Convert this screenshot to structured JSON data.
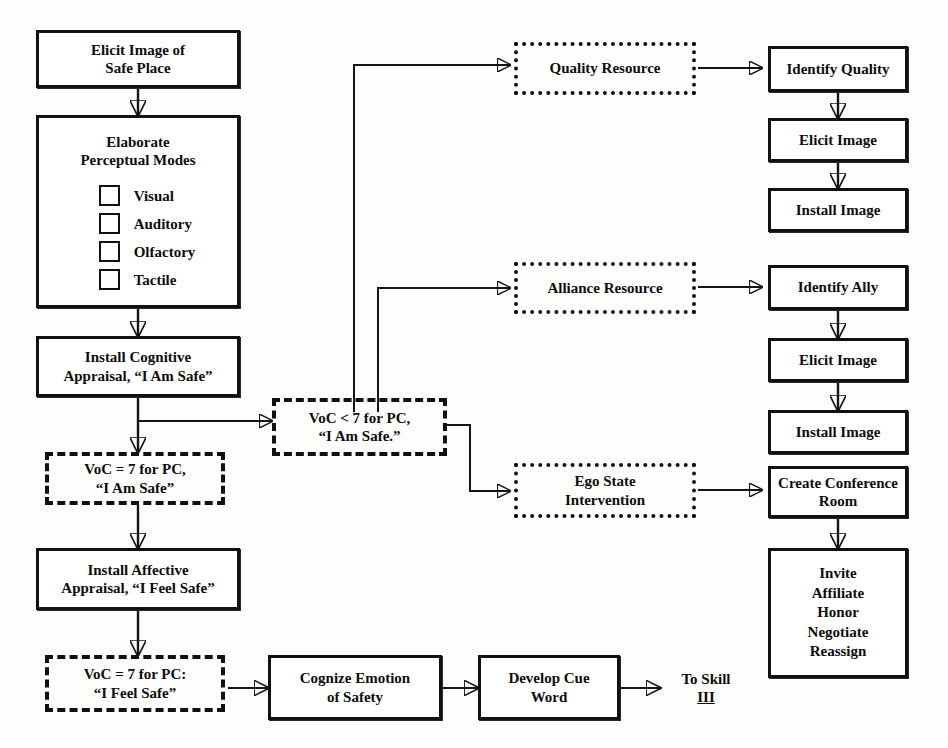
{
  "diagram": {
    "colors": {
      "stroke": "#151515",
      "node_border": "#111111",
      "text": "#0c0c0c",
      "background": "#fdfdfc"
    }
  },
  "nodes": {
    "elicit_image_safe_place": {
      "lines": [
        "Elicit Image of",
        "Safe Place"
      ],
      "style": "solid"
    },
    "elaborate_perceptual_modes": {
      "title_lines": [
        "Elaborate",
        "Perceptual Modes"
      ],
      "style": "solid",
      "modes": [
        "Visual",
        "Auditory",
        "Olfactory",
        "Tactile"
      ]
    },
    "install_cognitive_appraisal": {
      "lines": [
        "Install Cognitive",
        "Appraisal, “I Am Safe”"
      ],
      "style": "solid"
    },
    "voc_equals_7_i_am_safe": {
      "lines": [
        "VoC = 7 for PC,",
        "“I Am Safe”"
      ],
      "style": "dashed"
    },
    "voc_less_than_7_i_am_safe": {
      "lines": [
        "VoC < 7 for PC,",
        "“I Am Safe.”"
      ],
      "style": "dashed"
    },
    "install_affective_appraisal": {
      "lines": [
        "Install Affective",
        "Appraisal, “I Feel Safe”"
      ],
      "style": "solid"
    },
    "voc_equals_7_i_feel_safe": {
      "lines": [
        "VoC = 7 for PC:",
        "“I Feel Safe”"
      ],
      "style": "dashed"
    },
    "cognize_emotion_of_safety": {
      "lines": [
        "Cognize Emotion",
        "of Safety"
      ],
      "style": "solid"
    },
    "develop_cue_word": {
      "lines": [
        "Develop Cue",
        "Word"
      ],
      "style": "solid"
    },
    "to_skill_iii": {
      "lines": [
        "To Skill",
        "III"
      ],
      "style": "plain",
      "underline_last": true
    },
    "quality_resource": {
      "lines": [
        "Quality Resource"
      ],
      "style": "dotted"
    },
    "identify_quality": {
      "lines": [
        "Identify Quality"
      ],
      "style": "solid"
    },
    "elicit_image_quality": {
      "lines": [
        "Elicit Image"
      ],
      "style": "solid"
    },
    "install_image_quality": {
      "lines": [
        "Install Image"
      ],
      "style": "solid"
    },
    "alliance_resource": {
      "lines": [
        "Alliance Resource"
      ],
      "style": "dotted"
    },
    "identify_ally": {
      "lines": [
        "Identify  Ally"
      ],
      "style": "solid"
    },
    "elicit_image_ally": {
      "lines": [
        "Elicit Image"
      ],
      "style": "solid"
    },
    "install_image_ally": {
      "lines": [
        "Install Image"
      ],
      "style": "solid"
    },
    "ego_state_intervention": {
      "lines": [
        "Ego State",
        "Intervention"
      ],
      "style": "dotted"
    },
    "create_conference_room": {
      "lines": [
        "Create Conference",
        "Room"
      ],
      "style": "solid"
    },
    "conference_actions": {
      "lines": [
        "Invite",
        "Affiliate",
        "Honor",
        "Negotiate",
        "Reassign"
      ],
      "style": "solid"
    }
  },
  "edges": [
    {
      "from": "elicit_image_safe_place",
      "to": "elaborate_perceptual_modes"
    },
    {
      "from": "elaborate_perceptual_modes",
      "to": "install_cognitive_appraisal"
    },
    {
      "from": "install_cognitive_appraisal",
      "to": "voc_equals_7_i_am_safe"
    },
    {
      "from": "install_cognitive_appraisal",
      "to": "voc_less_than_7_i_am_safe"
    },
    {
      "from": "voc_equals_7_i_am_safe",
      "to": "install_affective_appraisal"
    },
    {
      "from": "install_affective_appraisal",
      "to": "voc_equals_7_i_feel_safe"
    },
    {
      "from": "voc_equals_7_i_feel_safe",
      "to": "cognize_emotion_of_safety"
    },
    {
      "from": "cognize_emotion_of_safety",
      "to": "develop_cue_word"
    },
    {
      "from": "develop_cue_word",
      "to": "to_skill_iii"
    },
    {
      "from": "voc_less_than_7_i_am_safe",
      "to": "quality_resource"
    },
    {
      "from": "voc_less_than_7_i_am_safe",
      "to": "alliance_resource"
    },
    {
      "from": "voc_less_than_7_i_am_safe",
      "to": "ego_state_intervention"
    },
    {
      "from": "quality_resource",
      "to": "identify_quality"
    },
    {
      "from": "identify_quality",
      "to": "elicit_image_quality"
    },
    {
      "from": "elicit_image_quality",
      "to": "install_image_quality"
    },
    {
      "from": "alliance_resource",
      "to": "identify_ally"
    },
    {
      "from": "identify_ally",
      "to": "elicit_image_ally"
    },
    {
      "from": "elicit_image_ally",
      "to": "install_image_ally"
    },
    {
      "from": "ego_state_intervention",
      "to": "create_conference_room"
    },
    {
      "from": "create_conference_room",
      "to": "conference_actions"
    }
  ]
}
